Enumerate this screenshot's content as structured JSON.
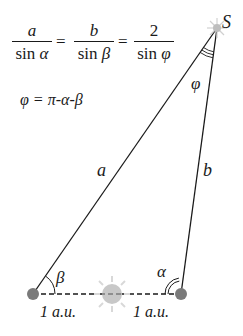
{
  "formula": {
    "fractions": [
      {
        "numerator": "a",
        "denominator_fn": "sin",
        "denominator_var": "α"
      },
      {
        "numerator": "b",
        "denominator_fn": "sin",
        "denominator_var": "β"
      },
      {
        "numerator": "2",
        "denominator_fn": "sin",
        "denominator_var": "φ"
      }
    ],
    "equals": "=",
    "relation": "φ = π-α-β"
  },
  "labels": {
    "star": "S",
    "side_a": "a",
    "side_b": "b",
    "angle_phi": "φ",
    "angle_beta": "β",
    "angle_alpha": "α",
    "distance_left": "1 a.u.",
    "distance_right": "1 a.u."
  },
  "colors": {
    "line": "#1a1a1a",
    "earth": "#7a7a7a",
    "sun_body": "#c8c8c8",
    "sun_rays": "#d4d4d4"
  }
}
